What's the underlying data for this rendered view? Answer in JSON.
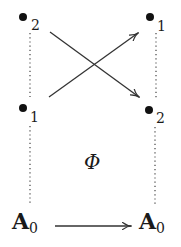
{
  "diagram": {
    "left_column": {
      "top_node": {
        "symbol": "•",
        "subscript": "2"
      },
      "middle_node": {
        "symbol": "•",
        "subscript": "1"
      },
      "bottom_node": {
        "label": "A",
        "subscript": "0"
      }
    },
    "right_column": {
      "top_node": {
        "symbol": "•",
        "subscript": "1"
      },
      "middle_node": {
        "symbol": "•",
        "subscript": "2"
      },
      "bottom_node": {
        "label": "A",
        "subscript": "0"
      }
    },
    "map_label": "Φ",
    "edges": [
      {
        "from": "left.top(2)",
        "to": "right.middle(2)",
        "style": "arrow"
      },
      {
        "from": "left.middle(1)",
        "to": "right.top(1)",
        "style": "arrow"
      },
      {
        "from": "left.A0",
        "to": "right.A0",
        "style": "arrow"
      }
    ],
    "colors": {
      "ink": "#1a1a1a",
      "background": "#ffffff"
    }
  }
}
